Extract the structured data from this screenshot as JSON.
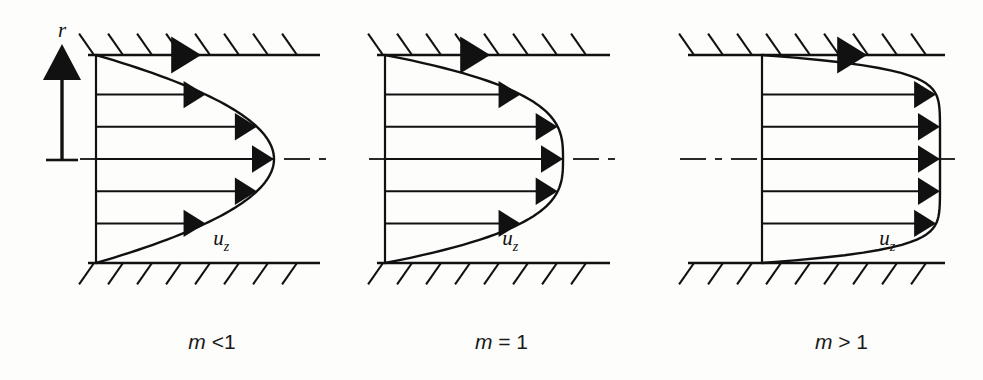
{
  "figure": {
    "title_present": false,
    "background_color": "#fdfdfc",
    "ink_color": "#111111",
    "axis_label_r": "r",
    "velocity_label_base": "u",
    "velocity_label_sub": "z"
  },
  "chart_data": {
    "type": "line",
    "title": "",
    "xlabel": "",
    "ylabel": "r",
    "grid": false,
    "legend": false,
    "x": [
      0.0,
      0.1,
      0.2,
      0.3,
      0.4,
      0.5,
      0.6,
      0.7,
      0.8,
      0.9,
      1.0
    ],
    "xlim": [
      0,
      1
    ],
    "ylim": [
      -1,
      1
    ],
    "series": [
      {
        "name": "m < 1",
        "caption_var": "m",
        "caption_op": "<",
        "caption_val": "1",
        "panel_index": 0,
        "profile_exponent": 1.0,
        "shape": "near-conical-pointed",
        "r_normalized": [
          -1.0,
          -0.8,
          -0.6,
          -0.4,
          -0.2,
          0.0,
          0.2,
          0.4,
          0.6,
          0.8,
          1.0
        ],
        "u_normalized": [
          0.0,
          0.2,
          0.4,
          0.6,
          0.8,
          1.0,
          0.8,
          0.6,
          0.4,
          0.2,
          0.0
        ],
        "arrow_r": [
          -1.0,
          -0.62,
          -0.31,
          0.0,
          0.31,
          0.62
        ],
        "arrow_u": [
          0.0,
          0.38,
          0.69,
          1.0,
          0.69,
          0.38
        ]
      },
      {
        "name": "m = 1",
        "caption_var": "m",
        "caption_op": "=",
        "caption_val": "1",
        "panel_index": 1,
        "profile_exponent": 2.0,
        "shape": "parabolic-newtonian",
        "r_normalized": [
          -1.0,
          -0.8,
          -0.6,
          -0.4,
          -0.2,
          0.0,
          0.2,
          0.4,
          0.6,
          0.8,
          1.0
        ],
        "u_normalized": [
          0.0,
          0.36,
          0.64,
          0.84,
          0.96,
          1.0,
          0.96,
          0.84,
          0.64,
          0.36,
          0.0
        ],
        "arrow_r": [
          -1.0,
          -0.62,
          -0.31,
          0.0,
          0.31,
          0.62
        ],
        "arrow_u": [
          0.0,
          0.62,
          0.9,
          1.0,
          0.9,
          0.62
        ]
      },
      {
        "name": "m > 1",
        "caption_var": "m",
        "caption_op": ">",
        "caption_val": "1",
        "panel_index": 2,
        "profile_exponent": 7.0,
        "shape": "flattened-plug-like",
        "r_normalized": [
          -1.0,
          -0.8,
          -0.6,
          -0.4,
          -0.2,
          0.0,
          0.2,
          0.4,
          0.6,
          0.8,
          1.0
        ],
        "u_normalized": [
          0.0,
          0.79,
          0.94,
          0.98,
          1.0,
          1.0,
          1.0,
          0.98,
          0.94,
          0.79,
          0.0
        ],
        "arrow_r": [
          -1.0,
          -0.62,
          -0.31,
          0.0,
          0.31,
          0.62
        ],
        "arrow_u": [
          0.0,
          0.96,
          1.0,
          1.0,
          1.0,
          0.96
        ]
      }
    ]
  },
  "panels": [
    {
      "id": "panel-m-lt-1",
      "caption": "m <1",
      "caption_var": "m",
      "caption_rest": " <1",
      "origin_x": 96,
      "wall_x_start": 88,
      "wall_x_end": 320,
      "has_ordinate_axis": true
    },
    {
      "id": "panel-m-eq-1",
      "caption": "m = 1",
      "caption_var": "m",
      "caption_rest": " = 1",
      "origin_x": 385,
      "wall_x_start": 377,
      "wall_x_end": 610,
      "has_ordinate_axis": false
    },
    {
      "id": "panel-m-gt-1",
      "caption": "m > 1",
      "caption_var": "m",
      "caption_rest": " > 1",
      "origin_x": 762,
      "wall_x_start": 688,
      "wall_x_end": 945,
      "has_ordinate_axis": false
    }
  ],
  "geometry": {
    "top_wall_y": 55,
    "bottom_wall_y": 263,
    "centerline_y": 159,
    "caption_y": 349,
    "hatch_length": 26,
    "hatch_spacing": 29,
    "hatch_angle_deg": 55
  }
}
